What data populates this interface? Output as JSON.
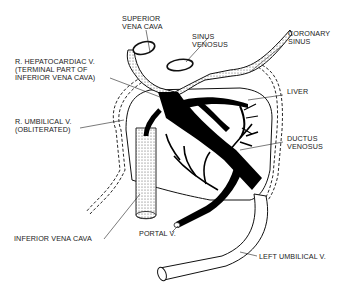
{
  "diagram": {
    "colors": {
      "ink": "#111111",
      "background": "#ffffff",
      "stipple": "#bbbbbb"
    },
    "labels": {
      "superior_vena_cava": [
        "SUPERIOR",
        "VENA CAVA"
      ],
      "sinus_venosus": [
        "SINUS",
        "VENOSUS"
      ],
      "coronary_sinus": [
        "CORONARY",
        "SINUS"
      ],
      "r_hepatocardiac_v": [
        "R. HEPATOCARDIAC V.",
        "(TERMINAL PART OF",
        "INFERIOR VENA CAVA)"
      ],
      "liver": [
        "LIVER"
      ],
      "r_umbilical_v": [
        "R. UMBILICAL V.",
        "(OBLITERATED)"
      ],
      "ductus_venosus": [
        "DUCTUS",
        "VENOSUS"
      ],
      "inferior_vena_cava": [
        "INFERIOR VENA CAVA"
      ],
      "portal_v": [
        "PORTAL V."
      ],
      "left_umbilical_v": [
        "LEFT UMBILICAL V."
      ]
    }
  }
}
